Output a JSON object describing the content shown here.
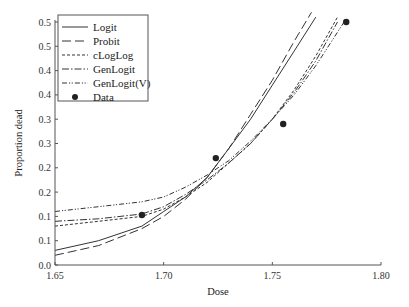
{
  "chart_data": {
    "type": "line",
    "title": "",
    "xlabel": "Dose",
    "ylabel": "Proportion dead",
    "xlim": [
      1.65,
      1.8
    ],
    "ylim": [
      0.0,
      0.5
    ],
    "grid": false,
    "legend_position": "upper left",
    "x_ticks": [
      "1.65",
      "1.70",
      "1.75",
      "1.80"
    ],
    "x_tick_values": [
      1.65,
      1.7,
      1.75,
      1.8
    ],
    "y_ticks": [
      "0.0",
      "0.1",
      "0.1",
      "0.2",
      "0.2",
      "0.3",
      "0.3",
      "0.4",
      "0.4",
      "0.5",
      "0.5"
    ],
    "y_tick_values": [
      0.0,
      0.05,
      0.1,
      0.15,
      0.2,
      0.25,
      0.3,
      0.35,
      0.4,
      0.45,
      0.5
    ],
    "legend": [
      "Logit",
      "Probit",
      "cLogLog",
      "GenLogit",
      "GenLogit(V)",
      "Data"
    ],
    "series": [
      {
        "name": "Logit",
        "style": "solid",
        "x": [
          1.65,
          1.67,
          1.69,
          1.7,
          1.71,
          1.72,
          1.73,
          1.74,
          1.75,
          1.76,
          1.77
        ],
        "y": [
          0.03,
          0.05,
          0.08,
          0.11,
          0.14,
          0.18,
          0.24,
          0.3,
          0.37,
          0.44,
          0.51
        ]
      },
      {
        "name": "Probit",
        "style": "long-dash",
        "x": [
          1.65,
          1.67,
          1.69,
          1.7,
          1.71,
          1.72,
          1.73,
          1.74,
          1.75,
          1.76,
          1.768
        ],
        "y": [
          0.02,
          0.04,
          0.075,
          0.1,
          0.135,
          0.18,
          0.24,
          0.31,
          0.38,
          0.46,
          0.52
        ]
      },
      {
        "name": "cLogLog",
        "style": "short-dash",
        "x": [
          1.65,
          1.67,
          1.69,
          1.7,
          1.71,
          1.72,
          1.73,
          1.74,
          1.75,
          1.76,
          1.77,
          1.78
        ],
        "y": [
          0.08,
          0.09,
          0.1,
          0.115,
          0.14,
          0.17,
          0.21,
          0.25,
          0.3,
          0.36,
          0.43,
          0.51
        ]
      },
      {
        "name": "GenLogit",
        "style": "dash-dot",
        "x": [
          1.65,
          1.67,
          1.69,
          1.7,
          1.71,
          1.72,
          1.73,
          1.74,
          1.75,
          1.76,
          1.77,
          1.78
        ],
        "y": [
          0.09,
          0.095,
          0.105,
          0.12,
          0.145,
          0.175,
          0.21,
          0.25,
          0.3,
          0.355,
          0.42,
          0.5
        ]
      },
      {
        "name": "GenLogit(V)",
        "style": "dash-dot-dot",
        "x": [
          1.65,
          1.67,
          1.69,
          1.7,
          1.71,
          1.72,
          1.73,
          1.74,
          1.75,
          1.76,
          1.77,
          1.783
        ],
        "y": [
          0.11,
          0.12,
          0.13,
          0.14,
          0.16,
          0.185,
          0.215,
          0.255,
          0.3,
          0.35,
          0.41,
          0.5
        ]
      },
      {
        "name": "Data",
        "style": "markers",
        "x": [
          1.69,
          1.724,
          1.755,
          1.784
        ],
        "y": [
          0.103,
          0.22,
          0.29,
          0.5
        ]
      }
    ]
  }
}
